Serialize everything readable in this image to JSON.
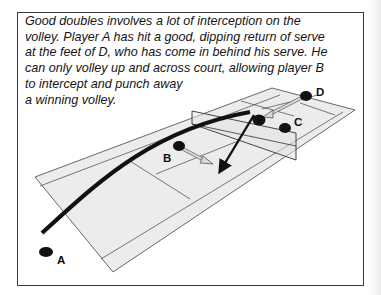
{
  "caption": {
    "lines": [
      "Good doubles involves a lot of interception on the",
      "volley. Player A has hit a good, dipping return of serve",
      "at the feet of D, who has come in behind his serve. He",
      "can only volley up and across court, allowing player B",
      "to intercept and punch away",
      "a winning volley."
    ]
  },
  "diagram": {
    "players": [
      {
        "id": "A",
        "label": "A"
      },
      {
        "id": "B",
        "label": "B"
      },
      {
        "id": "C",
        "label": "C"
      },
      {
        "id": "D",
        "label": "D"
      }
    ],
    "colors": {
      "court_fill": "#ececec",
      "court_line": "#444444",
      "player": "#111111",
      "ball_path": "#111111",
      "movement_arrow": "#d8d8d8"
    }
  }
}
